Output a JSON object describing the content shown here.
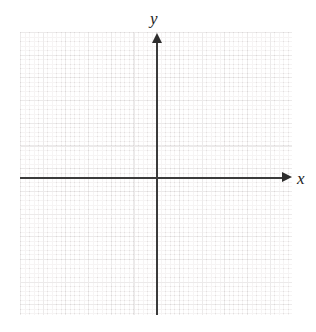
{
  "figure": {
    "kind": "blank-cartesian-grid",
    "background_color": "#ffffff",
    "axis_color": "#3b3b3b",
    "major_grid_color": "#eceaea",
    "minor_grid_color": "#f6f4f4"
  },
  "axes": {
    "x": {
      "label": "x",
      "arrow_icon_name": "arrow-right-icon",
      "orientation": "horizontal"
    },
    "y": {
      "label": "y",
      "arrow_icon_name": "arrow-up-icon",
      "orientation": "vertical"
    }
  },
  "chart_data": {
    "type": "scatter",
    "title": "",
    "subtitle": "",
    "xlabel": "x",
    "ylabel": "y",
    "series": [],
    "x": [],
    "values": [],
    "annotations": [],
    "legend": [],
    "legend_position": "none",
    "grid": true,
    "grid_style": "graph-paper-dotted",
    "major_grid_spacing_px": 22.7,
    "minor_grid_spacing_px": 4.54,
    "xtick_labels": [],
    "ytick_labels": [],
    "xlim": [
      -6,
      6
    ],
    "ylim": [
      -6,
      6
    ],
    "origin_label": ""
  }
}
